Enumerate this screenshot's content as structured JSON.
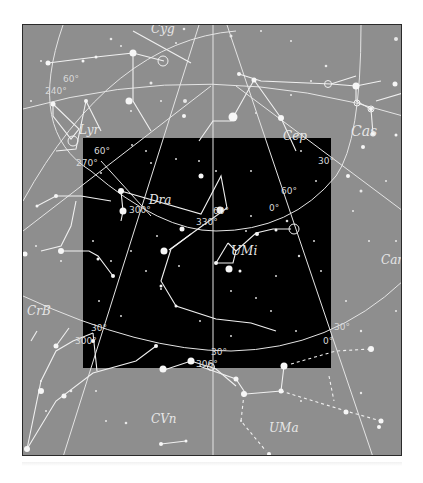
{
  "chart": {
    "background_color": "#8e8e8e",
    "highlight_color": "#000000",
    "line_color": "#e8e8e8",
    "constellations": [
      {
        "abbr": "Cyg",
        "x": 150,
        "y": 32,
        "size": 12
      },
      {
        "abbr": "Cep",
        "x": 282,
        "y": 139,
        "size": 12
      },
      {
        "abbr": "Cas",
        "x": 350,
        "y": 135,
        "size": 14
      },
      {
        "abbr": "Lyr",
        "x": 78,
        "y": 133,
        "size": 12
      },
      {
        "abbr": "Dra",
        "x": 148,
        "y": 203,
        "size": 12
      },
      {
        "abbr": "UMi",
        "x": 230,
        "y": 254,
        "size": 12
      },
      {
        "abbr": "Cam",
        "x": 380,
        "y": 263,
        "size": 12
      },
      {
        "abbr": "CrB",
        "x": 26,
        "y": 314,
        "size": 12
      },
      {
        "abbr": "CVn",
        "x": 150,
        "y": 422,
        "size": 12
      },
      {
        "abbr": "UMa",
        "x": 268,
        "y": 431,
        "size": 12
      }
    ],
    "degree_labels": [
      {
        "text": "60°",
        "x": 62,
        "y": 81
      },
      {
        "text": "240°",
        "x": 44,
        "y": 93
      },
      {
        "text": "60°",
        "x": 93,
        "y": 153
      },
      {
        "text": "270°",
        "x": 75,
        "y": 165
      },
      {
        "text": "300°",
        "x": 128,
        "y": 212
      },
      {
        "text": "60°",
        "x": 212,
        "y": 213
      },
      {
        "text": "330°",
        "x": 195,
        "y": 224
      },
      {
        "text": "60°",
        "x": 280,
        "y": 193
      },
      {
        "text": "0°",
        "x": 268,
        "y": 210
      },
      {
        "text": "30°",
        "x": 317,
        "y": 163
      },
      {
        "text": "30°",
        "x": 90,
        "y": 330
      },
      {
        "text": "300°",
        "x": 74,
        "y": 343
      },
      {
        "text": "30°",
        "x": 210,
        "y": 354
      },
      {
        "text": "30°",
        "x": 333,
        "y": 329
      },
      {
        "text": "0°",
        "x": 322,
        "y": 343
      },
      {
        "text": "306°",
        "x": 195,
        "y": 366
      }
    ]
  }
}
